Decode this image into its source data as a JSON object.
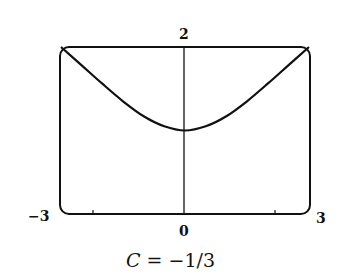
{
  "chart_data": {
    "type": "line",
    "title": "",
    "caption": "C = −1/3",
    "caption_var": "C",
    "caption_rest": " = −1/3",
    "xlabel": "",
    "ylabel": "",
    "xlim": [
      -3,
      3
    ],
    "ylim": [
      0,
      2
    ],
    "x_tick_labels": {
      "min": "−3",
      "center": "0",
      "max": "3"
    },
    "y_tick_labels": {
      "top": "2"
    },
    "grid": false,
    "legend": null,
    "series": [
      {
        "name": "solution curve",
        "x": [
          -3,
          -2.5,
          -2,
          -1.5,
          -1,
          -0.5,
          0,
          0.5,
          1,
          1.5,
          2,
          2.5,
          3
        ],
        "y": [
          2.0,
          1.78,
          1.56,
          1.35,
          1.17,
          1.05,
          1.0,
          1.05,
          1.17,
          1.35,
          1.56,
          1.78,
          2.0
        ]
      }
    ]
  }
}
